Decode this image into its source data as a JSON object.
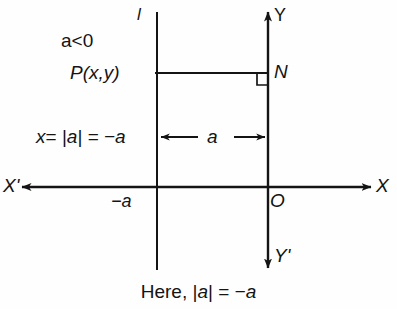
{
  "figure": {
    "title": "",
    "background_color": "#fefefe",
    "stroke_color": "#141414",
    "labels": {
      "line_l": "l",
      "y_axis_positive": "Y",
      "y_axis_negative": "Y'",
      "x_axis_positive": "X",
      "x_axis_negative": "X'",
      "origin": "O",
      "condition": "a<0",
      "point_p": "P(x,y)",
      "point_n": "N",
      "x_value": "x= |a| = −a",
      "distance": "a",
      "x_intercept": "−a"
    },
    "caption": "Here, |a| = −a",
    "caption_parts": {
      "lead": "Here,",
      "abs_open": "|",
      "abs_var": "a",
      "abs_close": "|",
      "equals": "=",
      "result": "−a"
    },
    "x_value_parts": {
      "var": "x",
      "eq1": "=",
      "abs_open": "|",
      "abs_var": "a",
      "abs_close": "|",
      "eq2": "=",
      "result": "−a"
    }
  },
  "geometry": {
    "x_axis_y": 187,
    "y_axis_x": 268,
    "line_l_x": 157,
    "p_segment_y": 73,
    "measure_arrow_y": 137,
    "right_angle_size": 11
  }
}
